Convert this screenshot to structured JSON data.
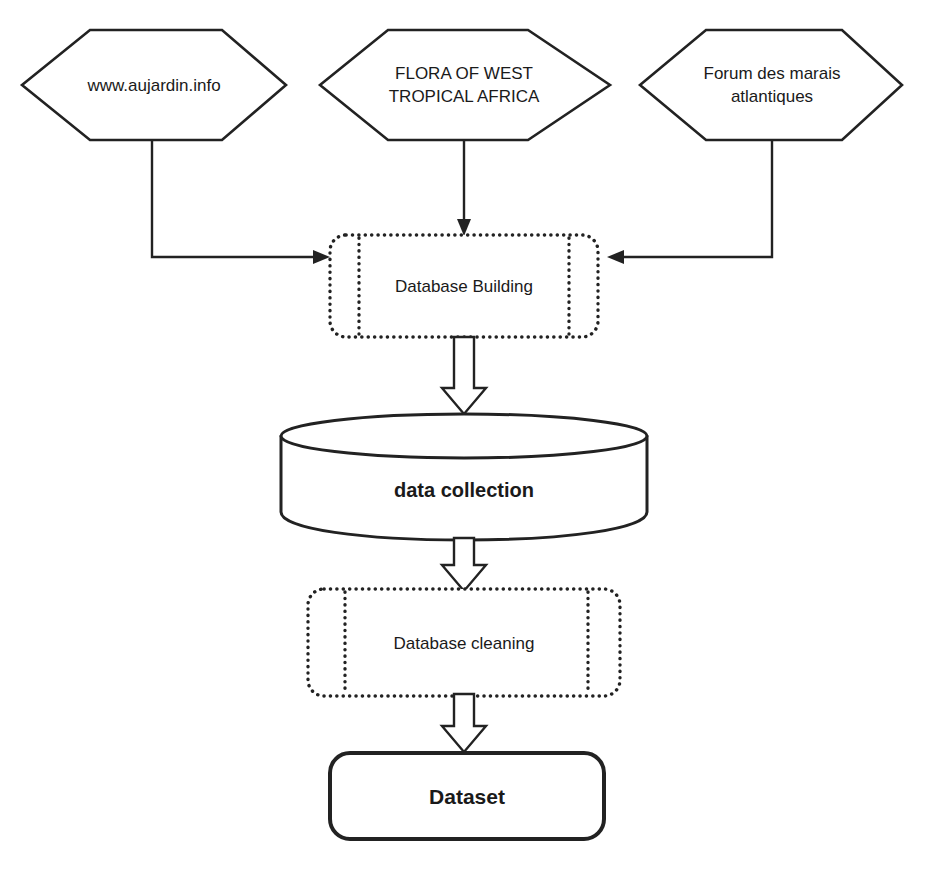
{
  "diagram": {
    "background_color": "#ffffff",
    "line_color": "#222222",
    "text_color": "#1a1a1a",
    "sources": [
      {
        "id": "source-aujardin",
        "shape": "hexagon",
        "label": "www.aujardin.info",
        "lines": [
          "www.aujardin.info"
        ]
      },
      {
        "id": "source-flora",
        "shape": "hexagon",
        "label": "FLORA OF WEST TROPICAL AFRICA",
        "lines": [
          "FLORA OF WEST",
          "TROPICAL AFRICA"
        ]
      },
      {
        "id": "source-forum",
        "shape": "hexagon",
        "label": "Forum des marais atlantiques",
        "lines": [
          "Forum des marais",
          "atlantiques"
        ]
      }
    ],
    "steps": [
      {
        "id": "database-building",
        "shape": "predefined-process",
        "label": "Database Building"
      },
      {
        "id": "data-collection",
        "shape": "cylinder",
        "label": "data collection"
      },
      {
        "id": "database-cleaning",
        "shape": "predefined-process",
        "label": "Database cleaning"
      },
      {
        "id": "dataset",
        "shape": "rounded-terminator",
        "label": "Dataset"
      }
    ],
    "connectors": [
      {
        "id": "conn-aujardin-to-building",
        "from": "source-aujardin",
        "to": "database-building",
        "style": "elbow-line",
        "arrowhead": "solid-triangle"
      },
      {
        "id": "conn-flora-to-building",
        "from": "source-flora",
        "to": "database-building",
        "style": "straight-line",
        "arrowhead": "solid-triangle"
      },
      {
        "id": "conn-forum-to-building",
        "from": "source-forum",
        "to": "database-building",
        "style": "elbow-line",
        "arrowhead": "solid-triangle"
      },
      {
        "id": "conn-building-to-collection",
        "from": "database-building",
        "to": "data-collection",
        "style": "block-arrow",
        "arrowhead": "hollow-block"
      },
      {
        "id": "conn-collection-to-cleaning",
        "from": "data-collection",
        "to": "database-cleaning",
        "style": "block-arrow",
        "arrowhead": "hollow-block"
      },
      {
        "id": "conn-cleaning-to-dataset",
        "from": "database-cleaning",
        "to": "dataset",
        "style": "block-arrow",
        "arrowhead": "hollow-block"
      }
    ]
  }
}
